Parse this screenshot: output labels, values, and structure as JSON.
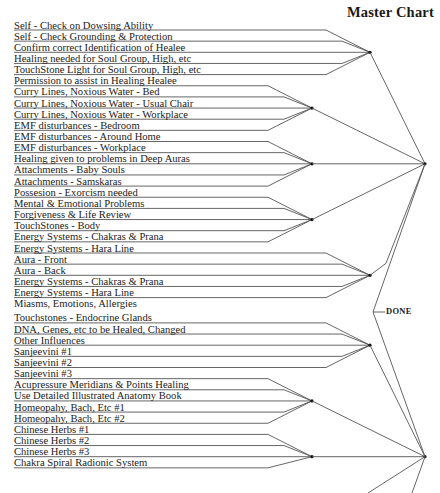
{
  "title": "Master Chart",
  "done_label": "DONE",
  "colors": {
    "line": "#555555",
    "text": "#222222",
    "node": "#111111"
  },
  "groups": [
    {
      "items": [
        "Self - Check on Dowsing Ability",
        "Self - Check Grounding & Protection",
        "Confirm correct Identification of Healee",
        "Healing needed for Soul Group, High, etc",
        "TouchStone Light for Soul Group, High, etc"
      ]
    },
    {
      "items": [
        "Permission to assist in Healing Healee",
        "Curry Lines, Noxious Water - Bed",
        "Curry Lines, Noxious Water - Usual Chair",
        "Curry Lines, Noxious Water - Workplace",
        "EMF disturbances - Bedroom"
      ]
    },
    {
      "items": [
        "EMF disturbances - Around Home",
        "EMF disturbances - Workplace",
        "Healing given to problems in Deep Auras",
        "Attachments - Baby Souls",
        "Attachments - Samskaras"
      ]
    },
    {
      "items": [
        "Possesion - Exorcism needed",
        "Mental & Emotional Problems",
        "Forgiveness & Life Review",
        "TouchStones - Body",
        "Energy Systems - Chakras & Prana"
      ]
    },
    {
      "items": [
        "Energy Systems - Hara Line",
        "Aura - Front",
        "Aura - Back",
        "Energy Systems - Chakras & Prana",
        "Energy Systems - Hara Line"
      ]
    },
    {
      "items": [
        "Miasms, Emotions, Allergies"
      ]
    },
    {
      "items": [
        "Touchstones - Endocrine Glands",
        "DNA, Genes, etc to be Healed, Changed",
        "Other Influences",
        "Sanjeevini #1",
        "Sanjeevini #2"
      ]
    },
    {
      "items": [
        "Sanjeevini #3",
        "Acupressure Meridians & Points Healing",
        "Use Detailed Illustrated Anatomy Book",
        "Homeopahy, Bach, Etc #1",
        "Homeopahy, Bach, Etc #2"
      ]
    },
    {
      "items": [
        "Chinese Herbs #1",
        "Chinese Herbs #2",
        "Chinese Herbs #3",
        "Chakra Spiral Radionic System"
      ]
    }
  ]
}
